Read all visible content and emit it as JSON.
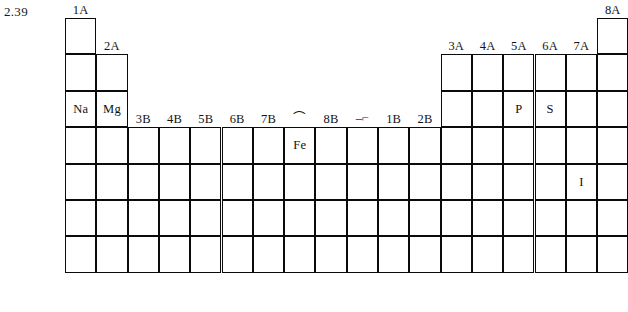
{
  "figure": {
    "number": "2.39"
  },
  "grid": {
    "origin_x": 65,
    "origin_y": 18,
    "cell_width": 31.3,
    "cell_height": 36.4,
    "columns": 18,
    "rows": 7
  },
  "group_labels": [
    {
      "text": "1A",
      "column": 1,
      "above_row": 1
    },
    {
      "text": "2A",
      "column": 2,
      "above_row": 2
    },
    {
      "text": "3B",
      "column": 3,
      "above_row": 4
    },
    {
      "text": "4B",
      "column": 4,
      "above_row": 4
    },
    {
      "text": "5B",
      "column": 5,
      "above_row": 4
    },
    {
      "text": "6B",
      "column": 6,
      "above_row": 4
    },
    {
      "text": "7B",
      "column": 7,
      "above_row": 4
    },
    {
      "text": "8B",
      "column": 9,
      "above_row": 4
    },
    {
      "text": "1B",
      "column": 11,
      "above_row": 4
    },
    {
      "text": "2B",
      "column": 12,
      "above_row": 4
    },
    {
      "text": "3A",
      "column": 13,
      "above_row": 2
    },
    {
      "text": "4A",
      "column": 14,
      "above_row": 2
    },
    {
      "text": "5A",
      "column": 15,
      "above_row": 2
    },
    {
      "text": "6A",
      "column": 16,
      "above_row": 2
    },
    {
      "text": "7A",
      "column": 17,
      "above_row": 2
    },
    {
      "text": "8A",
      "column": 18,
      "above_row": 1
    }
  ],
  "eightb_marks": [
    {
      "text": "⌒",
      "column": 8,
      "above_row": 4
    },
    {
      "text": "–⌐",
      "column": 10,
      "above_row": 4
    }
  ],
  "blocks": [
    {
      "name": "group-1a",
      "columns": [
        1
      ],
      "row_start": 1,
      "row_end": 7
    },
    {
      "name": "group-2a",
      "columns": [
        2
      ],
      "row_start": 2,
      "row_end": 7
    },
    {
      "name": "transition-metals",
      "columns": [
        3,
        4,
        5,
        6,
        7,
        8,
        9,
        10,
        11,
        12
      ],
      "row_start": 4,
      "row_end": 7
    },
    {
      "name": "groups-3a-7a",
      "columns": [
        13,
        14,
        15,
        16,
        17
      ],
      "row_start": 2,
      "row_end": 7
    },
    {
      "name": "group-8a",
      "columns": [
        18
      ],
      "row_start": 1,
      "row_end": 7
    }
  ],
  "elements": [
    {
      "symbol": "Na",
      "column": 1,
      "row": 3
    },
    {
      "symbol": "Mg",
      "column": 2,
      "row": 3
    },
    {
      "symbol": "P",
      "column": 15,
      "row": 3
    },
    {
      "symbol": "S",
      "column": 16,
      "row": 3
    },
    {
      "symbol": "Fe",
      "column": 8,
      "row": 4
    },
    {
      "symbol": "I",
      "column": 17,
      "row": 5
    }
  ],
  "colors": {
    "line": "#0b0b0b",
    "text": "#101010",
    "background": "#ffffff"
  }
}
